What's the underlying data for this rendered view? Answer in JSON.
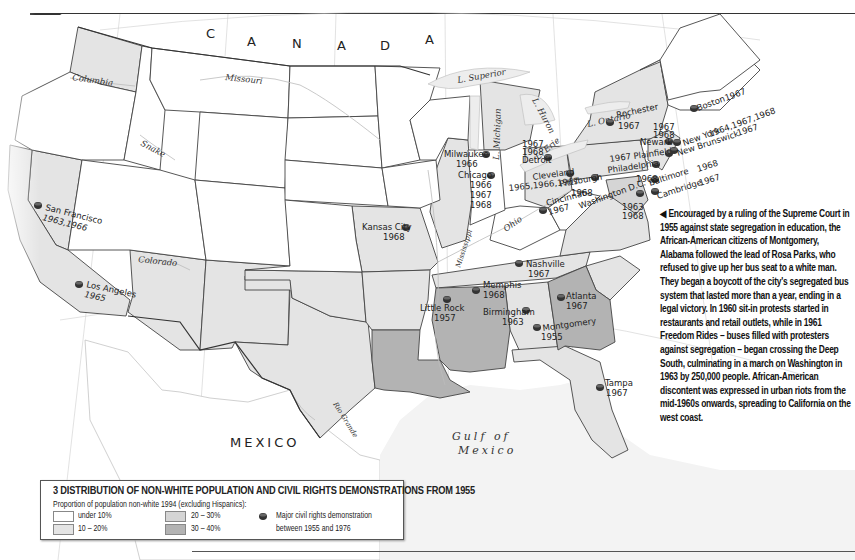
{
  "map": {
    "number": "3",
    "title": "Distribution of non-white population and civil rights demonstrations from 1955",
    "title_display": "3 DISTRIBUTION OF NON-WHITE POPULATION AND CIVIL RIGHTS DEMONSTRATIONS FROM 1955",
    "colors": {
      "under_10": "#ffffff",
      "10_20": "#e4e4e4",
      "20_30": "#d5d5d5",
      "30_40": "#b3b3b3",
      "border": "#444444",
      "water": "#ededed"
    },
    "labels": {
      "country_north": "C A N A D A",
      "country_north_letters": [
        "C",
        "A",
        "N",
        "A",
        "D",
        "A"
      ],
      "country_south": "MEXICO",
      "gulf_line1": "Gulf of",
      "gulf_line2": "Mexico"
    },
    "rivers": [
      {
        "name": "Columbia"
      },
      {
        "name": "Missouri"
      },
      {
        "name": "Snake"
      },
      {
        "name": "Colorado"
      },
      {
        "name": "Rio Grande"
      },
      {
        "name": "Mississippi"
      },
      {
        "name": "Ohio"
      }
    ],
    "lakes": [
      {
        "name": "L. Superior"
      },
      {
        "name": "L. Michigan"
      },
      {
        "name": "L. Huron"
      },
      {
        "name": "L. Erie"
      },
      {
        "name": "L. Ontario"
      }
    ],
    "graticule": [
      "120°",
      "110°",
      "100°",
      "90°",
      "80°",
      "70°",
      "30°"
    ],
    "demonstrations": [
      {
        "city": "San Francisco",
        "years": "1963,1966"
      },
      {
        "city": "Los Angeles",
        "years": "1965"
      },
      {
        "city": "Kansas City",
        "years": "1968"
      },
      {
        "city": "Milwaukee",
        "years": "1966"
      },
      {
        "city": "Chicago",
        "years_lines": [
          "1966",
          "1967",
          "1968"
        ]
      },
      {
        "city": "Detroit",
        "years_lines": [
          "1967",
          "1968"
        ]
      },
      {
        "city": "Cleveland",
        "years": "1965,1966,1967"
      },
      {
        "city": "Cincinnati",
        "years": "1967"
      },
      {
        "city": "Pittsburgh",
        "years": "1968"
      },
      {
        "city": "Washington D.C.",
        "years_lines": [
          "1963",
          "1968"
        ]
      },
      {
        "city": "Baltimore",
        "years": "1968"
      },
      {
        "city": "Cambridge",
        "years": "1967"
      },
      {
        "city": "Philadelphia",
        "years": "1968"
      },
      {
        "city": "Plainfield",
        "years": "1967"
      },
      {
        "city": "Newark",
        "years_lines": [
          "1967",
          "1968"
        ]
      },
      {
        "city": "New Brunswick",
        "years": "1967"
      },
      {
        "city": "New York",
        "years": "1964,1967,1968"
      },
      {
        "city": "Boston",
        "years": "1967"
      },
      {
        "city": "Rochester",
        "years": "1967"
      },
      {
        "city": "Nashville",
        "years": "1967"
      },
      {
        "city": "Memphis",
        "years": "1968"
      },
      {
        "city": "Little Rock",
        "years": "1957"
      },
      {
        "city": "Birmingham",
        "years": "1963"
      },
      {
        "city": "Atlanta",
        "years": "1967"
      },
      {
        "city": "Montgomery",
        "years": "1955"
      },
      {
        "city": "Tampa",
        "years": "1967"
      }
    ]
  },
  "caption": {
    "arrow": "◀",
    "text": "Encouraged by a ruling of the Supreme Court in 1955 against state segregation in education, the African-American citizens of Montgomery, Alabama followed the lead of Rosa Parks, who refused to give up her bus seat to a white man. They began a boycott of the city's segregated bus system that lasted more than a year, ending in a legal victory. In 1960 sit-in protests started in restaurants and retail outlets, while in 1961 Freedom Rides – buses filled with protesters against segregation – began crossing the Deep South, culminating in a march on Washington in 1963 by 250,000 people. African-American discontent was expressed in urban riots from the mid-1960s onwards, spreading to California on the west coast."
  },
  "legend": {
    "title": "3 DISTRIBUTION OF NON-WHITE POPULATION AND CIVIL RIGHTS DEMONSTRATIONS FROM 1955",
    "subtitle": "Proportion of population non-white 1994 (excluding Hispanics):",
    "items": [
      {
        "label": "under 10%",
        "color": "#ffffff"
      },
      {
        "label": "10 – 20%",
        "color": "#e4e4e4"
      },
      {
        "label": "20 – 30%",
        "color": "#d5d5d5"
      },
      {
        "label": "30 – 40%",
        "color": "#b3b3b3"
      }
    ],
    "symbol_line1": "Major civil rights demonstration",
    "symbol_line2": "between 1955 and 1976"
  }
}
